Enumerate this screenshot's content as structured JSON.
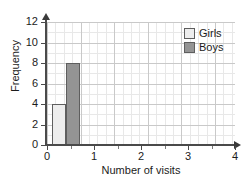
{
  "chart_data": {
    "type": "bar",
    "title": "",
    "xlabel": "Number of visits",
    "ylabel": "Frequency",
    "categories": [
      "0",
      "1",
      "2",
      "3",
      "4"
    ],
    "xlim": [
      0,
      4
    ],
    "ylim": [
      0,
      12
    ],
    "x_ticks": [
      "0",
      "1",
      "2",
      "3",
      "4"
    ],
    "y_ticks": [
      "0",
      "2",
      "4",
      "6",
      "8",
      "10",
      "12"
    ],
    "grid": true,
    "legend_position": "top-right",
    "series": [
      {
        "name": "Girls",
        "color": "#ededed",
        "edge_color": "#5e5e5e",
        "values": [
          4,
          0,
          0,
          0,
          0
        ]
      },
      {
        "name": "Boys",
        "color": "#949494",
        "edge_color": "#5e5e5e",
        "values": [
          8,
          0,
          0,
          0,
          0
        ]
      }
    ]
  },
  "legend": {
    "items": [
      {
        "label": "Girls",
        "swatch": "#ededed"
      },
      {
        "label": "Boys",
        "swatch": "#949494"
      }
    ]
  },
  "axes": {
    "x_title": "Number of visits",
    "y_title": "Frequency",
    "x_tick_labels": [
      "0",
      "1",
      "2",
      "3",
      "4"
    ],
    "y_tick_labels": [
      "12",
      "10",
      "8",
      "6",
      "4",
      "2",
      "0"
    ]
  }
}
